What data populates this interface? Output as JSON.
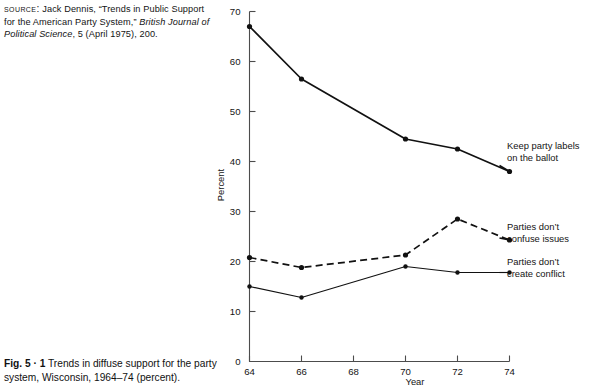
{
  "source_note": {
    "prefix": "Source:",
    "text_part1": " Jack Dennis, “Trends in Public Support for the American Party System,” ",
    "italic_part": "British Journal of Political Science",
    "text_part2": ", 5 (April 1975), 200."
  },
  "caption": {
    "figure_label": "Fig. 5 · 1",
    "text": " Trends in diffuse support for the party system, Wisconsin, 1964–74 (percent)."
  },
  "chart_data": {
    "type": "line",
    "title": "",
    "xlabel": "Year",
    "ylabel": "Percent",
    "xlim": [
      64,
      74
    ],
    "ylim": [
      0,
      70
    ],
    "xticks": [
      "64",
      "66",
      "68",
      "70",
      "72",
      "74"
    ],
    "yticks": [
      "0",
      "10",
      "20",
      "30",
      "40",
      "50",
      "60",
      "70"
    ],
    "grid": false,
    "legend_position": "right-inline-annotations",
    "x": [
      64,
      66,
      70,
      72,
      74
    ],
    "series": [
      {
        "name": "Keep party labels on the ballot",
        "label_line1": "Keep party labels",
        "label_line2": "on the ballot",
        "style": "solid-thick",
        "values": [
          67.0,
          56.5,
          44.5,
          42.5,
          38.0
        ]
      },
      {
        "name": "Parties don't confuse issues",
        "label_line1": "Parties don’t",
        "label_line2": "confuse issues",
        "style": "dashed",
        "values": [
          20.8,
          18.8,
          21.3,
          28.5,
          24.3
        ]
      },
      {
        "name": "Parties don't create conflict",
        "label_line1": "Parties don’t",
        "label_line2": "create conflict",
        "style": "solid-thin",
        "values": [
          15.0,
          12.8,
          19.0,
          17.8,
          17.8
        ]
      }
    ]
  },
  "colors": {
    "ink": "#111111",
    "axis": "#4c4c4c",
    "background": "#ffffff"
  }
}
